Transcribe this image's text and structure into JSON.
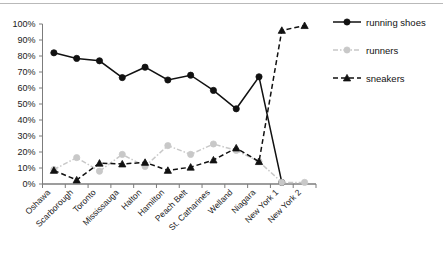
{
  "chart_data": {
    "type": "line",
    "title": "",
    "subtitle": "",
    "xlabel": "",
    "ylabel": "",
    "ylim": [
      0,
      100
    ],
    "ytick_labels": [
      "0%",
      "10%",
      "20%",
      "30%",
      "40%",
      "50%",
      "60%",
      "70%",
      "80%",
      "90%",
      "100%"
    ],
    "ytick_values": [
      0,
      10,
      20,
      30,
      40,
      50,
      60,
      70,
      80,
      90,
      100
    ],
    "grid": false,
    "legend_position": "right",
    "categories": [
      "Oshawa",
      "Scarborough",
      "Toronto",
      "Mississauga",
      "Halton",
      "Hamilton",
      "Peach Belt",
      "St. Catharines",
      "Welland",
      "Niagara",
      "New York 1",
      "New York 2"
    ],
    "series": [
      {
        "name": "running shoes",
        "color": "#111111",
        "marker": "circle",
        "linestyle": "solid",
        "values": [
          82,
          78.5,
          77,
          66.5,
          73,
          65,
          68,
          58.5,
          47,
          67,
          1,
          null
        ]
      },
      {
        "name": "runners",
        "color": "#c8c8c8",
        "marker": "circle",
        "linestyle": "dash-dot",
        "values": [
          9,
          16.5,
          8,
          18.5,
          11,
          24,
          18.5,
          25,
          21,
          14,
          1,
          1
        ]
      },
      {
        "name": "sneakers",
        "color": "#111111",
        "marker": "triangle",
        "linestyle": "dashed",
        "values": [
          8.5,
          2.5,
          13,
          12.5,
          13.5,
          8.5,
          10.5,
          15,
          22.5,
          14,
          96,
          99
        ]
      }
    ]
  },
  "legend": {
    "items": [
      {
        "label": "running shoes",
        "color": "#111111",
        "marker": "circle",
        "linestyle": "solid"
      },
      {
        "label": "runners",
        "color": "#c8c8c8",
        "marker": "circle",
        "linestyle": "dash-dot"
      },
      {
        "label": "sneakers",
        "color": "#111111",
        "marker": "triangle",
        "linestyle": "dashed"
      }
    ]
  },
  "axis": {
    "y_tick_labels": [
      "100%",
      "90%",
      "80%",
      "70%",
      "60%",
      "50%",
      "40%",
      "30%",
      "20%",
      "10%",
      "0%"
    ],
    "x_tick_labels": [
      "Oshawa",
      "Scarborough",
      "Toronto",
      "Mississauga",
      "Halton",
      "Hamilton",
      "Peach Belt",
      "St. Catharines",
      "Welland",
      "Niagara",
      "New York 1",
      "New York 2"
    ]
  },
  "colors": {
    "axis": "#7c7c7c",
    "dark_series": "#111111",
    "light_series": "#c8c8c8",
    "text": "#1a1a1a",
    "top_rule": "#b9b9b9",
    "background": "#ffffff"
  }
}
